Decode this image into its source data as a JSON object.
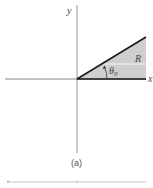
{
  "figure": {
    "caption": "(a)",
    "labels": {
      "y_axis": "y",
      "x_axis": "x",
      "region": "R",
      "angle": "θ",
      "angle_subscript": "0"
    },
    "colors": {
      "axis": "#777777",
      "boundary": "#1a1a1a",
      "region_fill": "#cfcfcf",
      "bottom_strip": "#d8d8d8"
    }
  }
}
